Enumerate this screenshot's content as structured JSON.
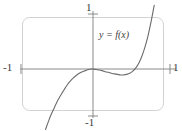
{
  "figure": {
    "title": "",
    "curve_label": "y = f(x)",
    "axis_labels": {
      "top": "1",
      "bottom": "-1",
      "left": "-1",
      "right": "1"
    },
    "colors": {
      "curve": "#6b6b6b",
      "axis": "#8a8a8a",
      "frame": "#d0d0d0",
      "text": "#3a3a3a",
      "background": "#ffffff"
    }
  },
  "chart_data": {
    "type": "line",
    "title": "",
    "xlabel": "",
    "ylabel": "",
    "xlim": [
      -1,
      1
    ],
    "ylim": [
      -1,
      1
    ],
    "xticks": [
      -1,
      1
    ],
    "xticklabels": [
      "-1",
      "1"
    ],
    "yticks": [
      -1,
      1
    ],
    "yticklabels": [
      "-1",
      "1"
    ],
    "grid": false,
    "legend": null,
    "annotations": [
      {
        "text": "y = f(x)",
        "x": 0.15,
        "y": 0.72
      }
    ],
    "series": [
      {
        "name": "y = f(x)",
        "x": [
          -0.62,
          -0.58,
          -0.54,
          -0.5,
          -0.46,
          -0.42,
          -0.38,
          -0.34,
          -0.3,
          -0.26,
          -0.22,
          -0.18,
          -0.14,
          -0.1,
          -0.06,
          -0.02,
          0.0,
          0.04,
          0.08,
          0.12,
          0.16,
          0.2,
          0.24,
          0.28,
          0.32,
          0.36,
          0.4,
          0.44,
          0.48,
          0.52,
          0.56,
          0.6,
          0.64,
          0.68,
          0.72,
          0.76,
          0.8
        ],
        "y": [
          -1.12,
          -0.96,
          -0.82,
          -0.7,
          -0.58,
          -0.48,
          -0.39,
          -0.3,
          -0.23,
          -0.17,
          -0.12,
          -0.08,
          -0.05,
          -0.03,
          -0.01,
          0.0,
          0.0,
          -0.01,
          -0.02,
          -0.03,
          -0.05,
          -0.06,
          -0.08,
          -0.09,
          -0.1,
          -0.11,
          -0.11,
          -0.1,
          -0.08,
          -0.04,
          0.02,
          0.11,
          0.24,
          0.41,
          0.62,
          0.88,
          1.18
        ]
      }
    ]
  }
}
